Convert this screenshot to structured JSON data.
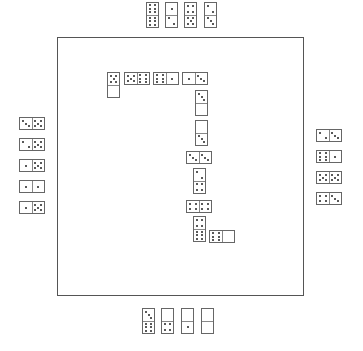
{
  "game": "Dominoes",
  "colors": {
    "board_border": "#555555",
    "tile_border": "#666666",
    "pip": "#222222",
    "background": "#ffffff"
  },
  "hands": {
    "top": {
      "orientation": "v",
      "tiles": [
        [
          6,
          6
        ],
        [
          1,
          2
        ],
        [
          4,
          5
        ],
        [
          2,
          3
        ]
      ],
      "x": [
        146,
        165,
        184,
        204
      ],
      "y": [
        2,
        2,
        2,
        2
      ]
    },
    "left": {
      "orientation": "h",
      "tiles": [
        [
          3,
          5
        ],
        [
          2,
          5
        ],
        [
          1,
          5
        ],
        [
          1,
          1
        ],
        [
          1,
          5
        ]
      ],
      "x": [
        19,
        19,
        19,
        19,
        19
      ],
      "y": [
        117,
        138,
        159,
        180,
        201
      ]
    },
    "right": {
      "orientation": "h",
      "tiles": [
        [
          2,
          3
        ],
        [
          6,
          1
        ],
        [
          5,
          5
        ],
        [
          4,
          3
        ]
      ],
      "x": [
        316,
        316,
        316,
        316
      ],
      "y": [
        129,
        150,
        171,
        192
      ]
    },
    "bottom": {
      "orientation": "v",
      "tiles": [
        [
          3,
          6
        ],
        [
          0,
          4
        ],
        [
          0,
          1
        ],
        [
          0,
          0
        ]
      ],
      "x": [
        142,
        161,
        181,
        201
      ],
      "y": [
        308,
        308,
        308,
        308
      ]
    }
  },
  "chain": [
    {
      "pips": [
        5,
        0
      ],
      "o": "v",
      "x": 107,
      "y": 72
    },
    {
      "pips": [
        5,
        6
      ],
      "o": "h",
      "x": 124,
      "y": 72
    },
    {
      "pips": [
        6,
        1
      ],
      "o": "h",
      "x": 153,
      "y": 72
    },
    {
      "pips": [
        1,
        3
      ],
      "o": "h",
      "x": 182,
      "y": 72
    },
    {
      "pips": [
        3,
        0
      ],
      "o": "v",
      "x": 195,
      "y": 90
    },
    {
      "pips": [
        0,
        3
      ],
      "o": "v",
      "x": 195,
      "y": 120
    },
    {
      "pips": [
        3,
        3
      ],
      "o": "h",
      "x": 186,
      "y": 151
    },
    {
      "pips": [
        2,
        4
      ],
      "o": "v",
      "x": 193,
      "y": 168
    },
    {
      "pips": [
        4,
        4
      ],
      "o": "h",
      "x": 186,
      "y": 200
    },
    {
      "pips": [
        4,
        6
      ],
      "o": "v",
      "x": 193,
      "y": 216
    },
    {
      "pips": [
        6,
        0
      ],
      "o": "h",
      "x": 209,
      "y": 230
    }
  ]
}
